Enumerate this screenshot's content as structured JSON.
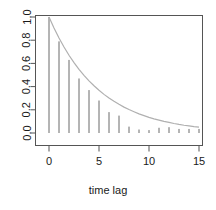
{
  "chart_data": {
    "type": "bar",
    "title": "",
    "subtitle": "",
    "xlabel": "time lag",
    "ylabel": "",
    "xlim": [
      -0.5,
      15.5
    ],
    "ylim": [
      0.0,
      1.0
    ],
    "grid": false,
    "legend": null,
    "x_tick_labels": [
      "0",
      "5",
      "10",
      "15"
    ],
    "x_tick_values": [
      0,
      5,
      10,
      15
    ],
    "y_tick_labels": [
      "0.0",
      "0.2",
      "0.4",
      "0.6",
      "0.8",
      "1.0"
    ],
    "y_tick_values": [
      0.0,
      0.2,
      0.4,
      0.6,
      0.8,
      1.0
    ],
    "categories": [
      0,
      1,
      2,
      3,
      4,
      5,
      6,
      7,
      8,
      9,
      10,
      11,
      12,
      13,
      14,
      15
    ],
    "values": [
      1.0,
      0.79,
      0.63,
      0.47,
      0.37,
      0.28,
      0.18,
      0.15,
      0.055,
      0.03,
      0.025,
      0.045,
      0.05,
      0.035,
      0.035,
      0.035
    ],
    "series": [
      {
        "name": "autocorrelation spikes",
        "type": "bar",
        "x": [
          0,
          1,
          2,
          3,
          4,
          5,
          6,
          7,
          8,
          9,
          10,
          11,
          12,
          13,
          14,
          15
        ],
        "values": [
          1.0,
          0.79,
          0.63,
          0.47,
          0.37,
          0.28,
          0.18,
          0.15,
          0.055,
          0.03,
          0.025,
          0.045,
          0.05,
          0.035,
          0.035,
          0.035
        ],
        "color": "#6b6b6b"
      },
      {
        "name": "exponential decay curve",
        "type": "line",
        "x": [
          0,
          0.5,
          1,
          1.5,
          2,
          2.5,
          3,
          3.5,
          4,
          4.5,
          5,
          5.5,
          6,
          6.5,
          7,
          7.5,
          8,
          8.5,
          9,
          9.5,
          10,
          10.5,
          11,
          11.5,
          12,
          12.5,
          13,
          13.5,
          14,
          14.5,
          15
        ],
        "values": [
          1.0,
          0.905,
          0.819,
          0.741,
          0.67,
          0.607,
          0.549,
          0.497,
          0.449,
          0.407,
          0.368,
          0.333,
          0.301,
          0.273,
          0.247,
          0.223,
          0.202,
          0.183,
          0.165,
          0.15,
          0.135,
          0.122,
          0.111,
          0.1,
          0.091,
          0.082,
          0.074,
          0.067,
          0.061,
          0.055,
          0.05
        ],
        "color": "#b0b0b0"
      }
    ],
    "colors": {
      "spike": "#6b6b6b",
      "curve": "#b0b0b0",
      "frame": "#555555",
      "text": "#1a1a1a",
      "background": "#ffffff"
    }
  },
  "axes": {
    "x_title": "time lag",
    "y_title": ""
  }
}
